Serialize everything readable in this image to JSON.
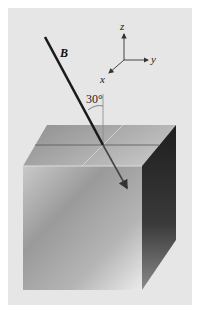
{
  "figure": {
    "vector_label": "B",
    "angle_label": "30°",
    "axes": {
      "z_label": "z",
      "y_label": "y",
      "x_label": "x"
    }
  },
  "colors": {
    "panel_bg": "#e6e6e6",
    "page_bg": "#ffffff",
    "vector": "#1a1a1a",
    "axis": "#333333"
  }
}
